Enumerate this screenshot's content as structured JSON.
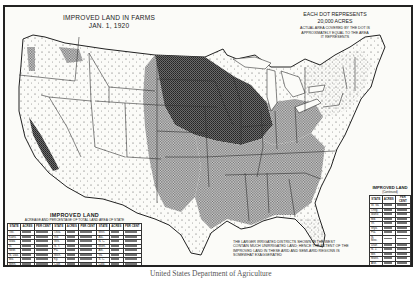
{
  "map": {
    "title": "IMPROVED LAND IN FARMS",
    "date": "JAN. 1, 1920",
    "legend": {
      "line1": "EACH DOT REPRESENTS",
      "line2": "20,000 ACRES",
      "note": "ACTUAL AREA COVERED BY THE DOT IS APPROXIMATELY EQUAL TO THE AREA IT REPRESENTS"
    },
    "footnote": "THE LARGER IRRIGATED DISTRICTS SHOWN IN THE WEST CONTAIN MUCH UNIRRIGATED LAND; HENCE THE EXTENT OF THE IMPROVED LAND IN THESE ARID AND SEMI-ARID REGIONS IS SOMEWHAT EXAGGERATED",
    "credit": "United States Department of Agriculture",
    "colors": {
      "ink": "#1a1a1a",
      "paper": "#fbfbf8",
      "border": "#222222"
    }
  },
  "table_main": {
    "title": "IMPROVED LAND",
    "subtitle": "ACREAGE AND PERCENTAGE OF TOTAL LAND AREA OF STATE",
    "headers": [
      "STATE",
      "ACRES",
      "PER CENT",
      "STATE",
      "ACRES",
      "PER CENT",
      "STATE",
      "ACRES",
      "PER CENT"
    ],
    "col1_states": [
      "Tex.",
      "Kans.",
      "Iowa",
      "Ill.",
      "Nebr.",
      "N. Dak.",
      "Mo.",
      "Minn.",
      "Ohio",
      "S. Dak."
    ],
    "col2_states": [
      "Okla.",
      "Ind.",
      "Wis.",
      "N. Y.",
      "Pa.",
      "Mich.",
      "Ky.",
      "Calif.",
      "Ga.",
      "Tenn."
    ],
    "col3_states": [
      "Miss.",
      "Ala.",
      "N. C.",
      "Mont.",
      "Ark.",
      "Va.",
      "S. C.",
      "Colo.",
      "Wash.",
      "La."
    ]
  },
  "table_side": {
    "title": "IMPROVED LAND",
    "subtitle": "(Continued)",
    "headers": [
      "STATE",
      "ACRES",
      "PER CENT"
    ],
    "states": [
      "W. Va.",
      "Oreg.",
      "Idaho",
      "Md.",
      "Vt.",
      "Wyo.",
      "Fla.",
      "N. Mex.",
      "Utah",
      "N. J.",
      "Me.",
      "Mass.",
      "Ariz.",
      "N. H.",
      "Conn.",
      "Del.",
      "Nev.",
      "R. I."
    ],
    "total_label": "U. S."
  }
}
